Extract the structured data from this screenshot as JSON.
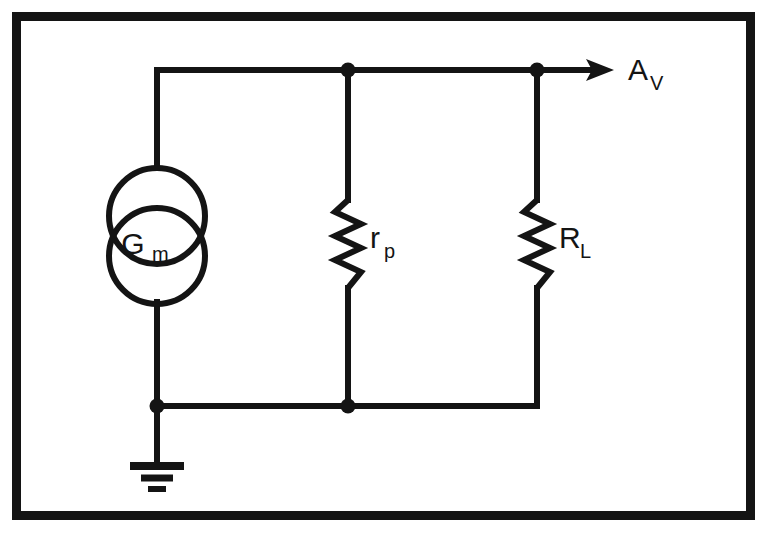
{
  "figure": {
    "kind": "circuit-diagram",
    "title": "",
    "background_color": "#ffffff",
    "ink_color": "#141414",
    "border": {
      "name": "figure-border",
      "style": "thick solid rectangle",
      "color": "#141414",
      "outer": {
        "x": 12,
        "y": 12,
        "width": 743,
        "height": 508
      },
      "thickness": 9
    }
  },
  "labels": {
    "source": {
      "base": "G",
      "sub": "m",
      "full": "Gm"
    },
    "plate_resistance": {
      "base": "r",
      "sub": "p",
      "full": "rp"
    },
    "load_resistance": {
      "base": "R",
      "sub": "L",
      "full": "RL"
    },
    "output": {
      "base": "A",
      "sub": "V",
      "full": "AV"
    }
  },
  "components": [
    {
      "id": "gm-source",
      "type": "dependent-current-source",
      "label": "Gm",
      "symbol": "double-overlapping-circles",
      "cx": 157,
      "circles": [
        {
          "cx": 157,
          "cy": 216,
          "r": 48
        },
        {
          "cx": 157,
          "cy": 256,
          "r": 48
        }
      ],
      "label_x": 157,
      "label_y": 244
    },
    {
      "id": "rp-resistor",
      "type": "resistor",
      "label": "rp",
      "orientation": "vertical",
      "x": 348,
      "y_top": 200,
      "y_bottom": 288,
      "zig_amplitude": 13,
      "zig_segments": 7,
      "label_x": 372,
      "label_y": 252
    },
    {
      "id": "rl-resistor",
      "type": "resistor",
      "label": "RL",
      "orientation": "vertical",
      "x": 537,
      "y_top": 200,
      "y_bottom": 288,
      "zig_amplitude": 13,
      "zig_segments": 7,
      "label_x": 561,
      "label_y": 252
    },
    {
      "id": "ground",
      "type": "earth-ground",
      "stem_x": 157,
      "stem_top": 406,
      "stem_bottom": 464,
      "bars": [
        {
          "width": 54,
          "y": 466
        },
        {
          "width": 32,
          "y": 478
        },
        {
          "width": 18,
          "y": 489
        }
      ]
    }
  ],
  "wires": [
    {
      "id": "top-rail",
      "x1": 157,
      "y1": 70,
      "x2": 591,
      "y2": 70
    },
    {
      "id": "left-upper",
      "x1": 157,
      "y1": 70,
      "x2": 157,
      "y2": 168
    },
    {
      "id": "left-lower",
      "x1": 157,
      "y1": 304,
      "x2": 157,
      "y2": 406
    },
    {
      "id": "bottom-rail",
      "x1": 157,
      "y1": 406,
      "x2": 537,
      "y2": 406
    },
    {
      "id": "rp-upper-lead",
      "x1": 348,
      "y1": 70,
      "x2": 348,
      "y2": 200
    },
    {
      "id": "rp-lower-lead",
      "x1": 348,
      "y1": 288,
      "x2": 348,
      "y2": 406
    },
    {
      "id": "rl-upper-lead",
      "x1": 537,
      "y1": 70,
      "x2": 537,
      "y2": 200
    },
    {
      "id": "rl-lower-lead",
      "x1": 537,
      "y1": 288,
      "x2": 537,
      "y2": 406
    }
  ],
  "nodes": [
    {
      "id": "node-top-rp",
      "cx": 348,
      "cy": 70,
      "r": 7
    },
    {
      "id": "node-top-rl",
      "cx": 537,
      "cy": 70,
      "r": 7
    },
    {
      "id": "node-gnd",
      "cx": 157,
      "cy": 406,
      "r": 7
    },
    {
      "id": "node-bot-rp",
      "cx": 348,
      "cy": 406,
      "r": 7
    }
  ],
  "output_arrow": {
    "id": "av-arrow",
    "x1": 537,
    "y1": 70,
    "x2": 612,
    "y2": 70,
    "head_length": 26,
    "head_half_width": 10,
    "label_x": 630,
    "label_y": 82
  }
}
